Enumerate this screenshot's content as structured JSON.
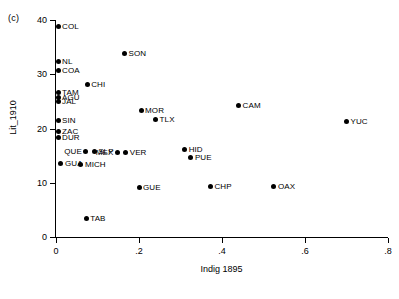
{
  "panel": {
    "tag": "(c)"
  },
  "axes": {
    "x": {
      "title": "Indig 1895",
      "ticks": [
        "0",
        ".2",
        ".4",
        ".6",
        ".8"
      ],
      "tick_values": [
        0,
        0.2,
        0.4,
        0.6,
        0.8
      ],
      "range": [
        0,
        0.8
      ]
    },
    "y": {
      "title": "Lit_1910",
      "ticks": [
        "0",
        "10",
        "20",
        "30",
        "40"
      ],
      "tick_values": [
        0,
        10,
        20,
        30,
        40
      ],
      "range": [
        0,
        40
      ]
    }
  },
  "chart_data": {
    "type": "scatter",
    "title": "(c)",
    "subtitle": "",
    "xlabel": "Indig 1895",
    "ylabel": "Lit_1910",
    "xlim": [
      0,
      0.8
    ],
    "ylim": [
      0,
      40
    ],
    "xticks": [
      0,
      0.2,
      0.4,
      0.6,
      0.8
    ],
    "xticklabels": [
      "0",
      ".2",
      ".4",
      ".6",
      ".8"
    ],
    "yticks": [
      0,
      10,
      20,
      30,
      40
    ],
    "yticklabels": [
      "0",
      "10",
      "20",
      "30",
      "40"
    ],
    "grid": false,
    "legend": false,
    "marker": "filled-circle",
    "marker_color": "#000000",
    "points": [
      {
        "label": "COL",
        "x": 0.005,
        "y": 38.8,
        "label_side": "right"
      },
      {
        "label": "NL",
        "x": 0.005,
        "y": 32.3,
        "label_side": "right"
      },
      {
        "label": "COA",
        "x": 0.005,
        "y": 30.6,
        "label_side": "right"
      },
      {
        "label": "SON",
        "x": 0.165,
        "y": 33.8,
        "label_side": "right"
      },
      {
        "label": "CHI",
        "x": 0.075,
        "y": 28.2,
        "label_side": "right"
      },
      {
        "label": "TAM",
        "x": 0.005,
        "y": 26.6,
        "label_side": "right"
      },
      {
        "label": "AGU",
        "x": 0.005,
        "y": 25.8,
        "label_side": "right"
      },
      {
        "label": "JAL",
        "x": 0.005,
        "y": 25.0,
        "label_side": "right"
      },
      {
        "label": "MOR",
        "x": 0.205,
        "y": 23.4,
        "label_side": "right"
      },
      {
        "label": "TLX",
        "x": 0.24,
        "y": 21.6,
        "label_side": "right"
      },
      {
        "label": "CAM",
        "x": 0.44,
        "y": 24.3,
        "label_side": "right"
      },
      {
        "label": "YUC",
        "x": 0.7,
        "y": 21.3,
        "label_side": "right"
      },
      {
        "label": "SIN",
        "x": 0.005,
        "y": 21.5,
        "label_side": "right"
      },
      {
        "label": "ZAC",
        "x": 0.005,
        "y": 19.5,
        "label_side": "right"
      },
      {
        "label": "DUR",
        "x": 0.005,
        "y": 18.4,
        "label_side": "right"
      },
      {
        "label": "QUE",
        "x": 0.072,
        "y": 15.8,
        "label_side": "left"
      },
      {
        "label": "SLP",
        "x": 0.092,
        "y": 15.8,
        "label_side": "right"
      },
      {
        "label": "MEX",
        "x": 0.148,
        "y": 15.5,
        "label_side": "left"
      },
      {
        "label": "VER",
        "x": 0.168,
        "y": 15.5,
        "label_side": "right"
      },
      {
        "label": "HID",
        "x": 0.31,
        "y": 16.2,
        "label_side": "right"
      },
      {
        "label": "PUE",
        "x": 0.325,
        "y": 14.6,
        "label_side": "right"
      },
      {
        "label": "GUA",
        "x": 0.012,
        "y": 13.5,
        "label_side": "right"
      },
      {
        "label": "MICH",
        "x": 0.06,
        "y": 13.3,
        "label_side": "right"
      },
      {
        "label": "GUE",
        "x": 0.2,
        "y": 9.1,
        "label_side": "right"
      },
      {
        "label": "CHP",
        "x": 0.372,
        "y": 9.3,
        "label_side": "right"
      },
      {
        "label": "OAX",
        "x": 0.525,
        "y": 9.4,
        "label_side": "right"
      },
      {
        "label": "TAB",
        "x": 0.073,
        "y": 3.5,
        "label_side": "right"
      }
    ]
  }
}
